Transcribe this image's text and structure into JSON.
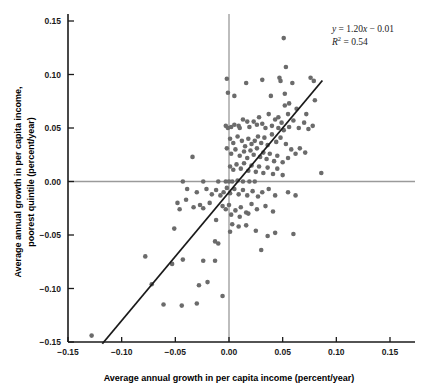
{
  "chart_data": {
    "type": "scatter",
    "title": "",
    "xlabel": "Average annual growth in per capita income (percent/year)",
    "ylabel_line1": "Average annual growth in per capita income,",
    "ylabel_line2": "poorest quintile (percent/year)",
    "xlim": [
      -0.15,
      0.15
    ],
    "ylim": [
      -0.15,
      0.15
    ],
    "xticks": [
      -0.15,
      -0.1,
      -0.05,
      0.0,
      0.05,
      0.1,
      0.15
    ],
    "yticks": [
      -0.15,
      -0.1,
      -0.05,
      0.0,
      0.05,
      0.1,
      0.15
    ],
    "xtick_labels": [
      "-0.15",
      "-0.10",
      "-0.05",
      "0.00",
      "0.05",
      "0.10",
      "0.15"
    ],
    "ytick_labels": [
      "-0.15",
      "-0.10",
      "-0.05",
      "0.00",
      "0.05",
      "0.10",
      "0.15"
    ],
    "grid": false,
    "legend": "none",
    "point_color": "#6b6b6b",
    "line_color": "#1a1a1a",
    "zero_line_color": "#9a9a9a",
    "axis_color": "#1a1a1a",
    "fit_line": {
      "slope": 1.2,
      "intercept": -0.01,
      "r_squared": 0.54,
      "x_start": -0.118,
      "y_start": -0.1516,
      "x_end": 0.087,
      "y_end": 0.0944
    },
    "annotations": {
      "equation_y": "y",
      "equation_rest": " = 1.20",
      "equation_x": "x",
      "equation_tail": " − 0.01",
      "r2_symbol": "R",
      "r2_sup": "2",
      "r2_value": " = 0.54"
    },
    "points": [
      [
        0.051,
        0.134
      ],
      [
        0.053,
        0.107
      ],
      [
        -0.002,
        0.096
      ],
      [
        0.016,
        0.092
      ],
      [
        0.031,
        0.095
      ],
      [
        0.047,
        0.097
      ],
      [
        0.048,
        0.094
      ],
      [
        0.059,
        0.092
      ],
      [
        0.076,
        0.097
      ],
      [
        0.079,
        0.094
      ],
      [
        -0.001,
        0.083
      ],
      [
        0.005,
        0.08
      ],
      [
        0.039,
        0.08
      ],
      [
        0.052,
        0.082
      ],
      [
        0.056,
        0.073
      ],
      [
        0.063,
        0.068
      ],
      [
        0.08,
        0.076
      ],
      [
        0.055,
        0.063
      ],
      [
        0.052,
        0.071
      ],
      [
        0.046,
        0.06
      ],
      [
        0.072,
        0.063
      ],
      [
        -0.034,
        0.023
      ],
      [
        -0.002,
        0.031
      ],
      [
        -0.003,
        0.052
      ],
      [
        -0.001,
        0.05
      ],
      [
        0.002,
        0.051
      ],
      [
        0.005,
        0.053
      ],
      [
        0.009,
        0.052
      ],
      [
        0.01,
        0.05
      ],
      [
        0.013,
        0.058
      ],
      [
        0.017,
        0.056
      ],
      [
        0.019,
        0.051
      ],
      [
        0.023,
        0.056
      ],
      [
        0.026,
        0.053
      ],
      [
        0.028,
        0.06
      ],
      [
        0.031,
        0.054
      ],
      [
        0.034,
        0.05
      ],
      [
        0.037,
        0.063
      ],
      [
        0.04,
        0.052
      ],
      [
        0.043,
        0.058
      ],
      [
        0.046,
        0.05
      ],
      [
        0.049,
        0.055
      ],
      [
        0.051,
        0.048
      ],
      [
        0.056,
        0.051
      ],
      [
        0.06,
        0.057
      ],
      [
        0.065,
        0.05
      ],
      [
        0.07,
        0.055
      ],
      [
        0.074,
        0.049
      ],
      [
        0.078,
        0.052
      ],
      [
        0.001,
        0.04
      ],
      [
        0.004,
        0.036
      ],
      [
        0.008,
        0.042
      ],
      [
        0.012,
        0.038
      ],
      [
        0.015,
        0.033
      ],
      [
        0.018,
        0.04
      ],
      [
        0.021,
        0.035
      ],
      [
        0.024,
        0.038
      ],
      [
        0.027,
        0.042
      ],
      [
        0.03,
        0.036
      ],
      [
        0.033,
        0.041
      ],
      [
        0.036,
        0.034
      ],
      [
        0.04,
        0.044
      ],
      [
        0.044,
        0.037
      ],
      [
        0.048,
        0.041
      ],
      [
        0.053,
        0.035
      ],
      [
        0.058,
        0.03
      ],
      [
        0.062,
        0.026
      ],
      [
        0.066,
        0.031
      ],
      [
        0.071,
        0.027
      ],
      [
        0.002,
        0.026
      ],
      [
        0.006,
        0.03
      ],
      [
        0.01,
        0.024
      ],
      [
        0.014,
        0.028
      ],
      [
        0.017,
        0.022
      ],
      [
        0.02,
        0.029
      ],
      [
        0.023,
        0.025
      ],
      [
        0.026,
        0.031
      ],
      [
        0.029,
        0.023
      ],
      [
        0.032,
        0.027
      ],
      [
        0.035,
        0.021
      ],
      [
        0.038,
        0.026
      ],
      [
        0.042,
        0.019
      ],
      [
        0.045,
        0.024
      ],
      [
        0.05,
        0.018
      ],
      [
        0.055,
        0.022
      ],
      [
        0.001,
        0.014
      ],
      [
        0.004,
        0.011
      ],
      [
        0.007,
        0.016
      ],
      [
        0.011,
        0.012
      ],
      [
        0.014,
        0.017
      ],
      [
        0.018,
        0.01
      ],
      [
        0.021,
        0.015
      ],
      [
        0.025,
        0.009
      ],
      [
        0.028,
        0.014
      ],
      [
        0.032,
        0.008
      ],
      [
        0.036,
        0.013
      ],
      [
        0.041,
        0.007
      ],
      [
        0.045,
        0.012
      ],
      [
        0.05,
        0.006
      ],
      [
        0.086,
        0.008
      ],
      [
        -0.043,
        0.0
      ],
      [
        -0.024,
        0.0
      ],
      [
        -0.01,
        0.0
      ],
      [
        -0.003,
        0.0
      ],
      [
        0.0,
        0.0
      ],
      [
        0.003,
        0.0
      ],
      [
        0.008,
        0.001
      ],
      [
        0.013,
        0.0
      ],
      [
        0.019,
        0.0
      ],
      [
        0.024,
        0.0
      ],
      [
        -0.039,
        -0.007
      ],
      [
        -0.03,
        -0.01
      ],
      [
        -0.021,
        -0.007
      ],
      [
        -0.016,
        -0.012
      ],
      [
        -0.012,
        -0.008
      ],
      [
        -0.008,
        -0.013
      ],
      [
        -0.005,
        -0.01
      ],
      [
        -0.002,
        -0.006
      ],
      [
        0.001,
        -0.011
      ],
      [
        0.005,
        -0.007
      ],
      [
        0.009,
        -0.012
      ],
      [
        0.013,
        -0.008
      ],
      [
        0.017,
        -0.013
      ],
      [
        0.022,
        -0.009
      ],
      [
        0.027,
        -0.014
      ],
      [
        0.031,
        -0.01
      ],
      [
        0.037,
        -0.007
      ],
      [
        0.043,
        -0.013
      ],
      [
        0.055,
        -0.01
      ],
      [
        0.062,
        -0.013
      ],
      [
        -0.048,
        -0.02
      ],
      [
        -0.04,
        -0.017
      ],
      [
        -0.033,
        -0.024
      ],
      [
        -0.046,
        -0.026
      ],
      [
        -0.027,
        -0.022
      ],
      [
        -0.024,
        -0.025
      ],
      [
        -0.018,
        -0.02
      ],
      [
        -0.006,
        -0.023
      ],
      [
        -0.003,
        -0.026
      ],
      [
        0.0,
        -0.022
      ],
      [
        0.006,
        -0.027
      ],
      [
        0.011,
        -0.024
      ],
      [
        0.016,
        -0.029
      ],
      [
        0.021,
        -0.021
      ],
      [
        0.026,
        -0.026
      ],
      [
        0.034,
        -0.023
      ],
      [
        0.041,
        -0.028
      ],
      [
        0.002,
        -0.031
      ],
      [
        0.01,
        -0.033
      ],
      [
        0.018,
        -0.03
      ],
      [
        -0.051,
        -0.044
      ],
      [
        -0.012,
        -0.036
      ],
      [
        0.003,
        -0.04
      ],
      [
        0.009,
        -0.042
      ],
      [
        0.016,
        -0.041
      ],
      [
        0.001,
        -0.047
      ],
      [
        0.025,
        -0.046
      ],
      [
        0.043,
        -0.048
      ],
      [
        0.06,
        -0.049
      ],
      [
        0.036,
        -0.051
      ],
      [
        -0.013,
        -0.056
      ],
      [
        -0.01,
        -0.058
      ],
      [
        0.03,
        -0.064
      ],
      [
        -0.078,
        -0.07
      ],
      [
        -0.043,
        -0.073
      ],
      [
        -0.024,
        -0.074
      ],
      [
        -0.013,
        -0.074
      ],
      [
        -0.053,
        -0.077
      ],
      [
        -0.072,
        -0.096
      ],
      [
        -0.028,
        -0.097
      ],
      [
        -0.02,
        -0.094
      ],
      [
        -0.006,
        -0.107
      ],
      [
        -0.061,
        -0.115
      ],
      [
        -0.044,
        -0.116
      ],
      [
        -0.03,
        -0.114
      ],
      [
        -0.128,
        -0.144
      ]
    ]
  }
}
